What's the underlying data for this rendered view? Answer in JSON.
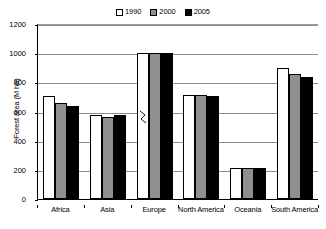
{
  "chart_data": {
    "type": "bar",
    "title": "",
    "xlabel": "",
    "ylabel": "Forest area (M ha)",
    "ylim": [
      0,
      1200
    ],
    "yticks": [
      0,
      200,
      400,
      600,
      800,
      1000,
      1200
    ],
    "ytick_labels": [
      "0",
      "200",
      "400",
      "600",
      "800",
      "1000",
      "1200"
    ],
    "grid": true,
    "legend_position": "top-center",
    "categories": [
      "Africa",
      "Asia",
      "Europe",
      "North America",
      "Oceania",
      "South America"
    ],
    "series": [
      {
        "name": "1990",
        "color": "#ffffff",
        "values": [
          705,
          575,
          1000,
          715,
          215,
          900
        ]
      },
      {
        "name": "2000",
        "color": "#8f8f8f",
        "values": [
          655,
          565,
          1000,
          710,
          210,
          860
        ]
      },
      {
        "name": "2005",
        "color": "#000000",
        "values": [
          635,
          575,
          1000,
          705,
          210,
          840
        ]
      }
    ],
    "annotations": [
      {
        "type": "axis-break",
        "category": "Europe",
        "series": "1990",
        "note": "value exceeds axis maximum"
      }
    ]
  },
  "legend": {
    "entries": [
      {
        "label": "1990"
      },
      {
        "label": "2000"
      },
      {
        "label": "2005"
      }
    ]
  }
}
